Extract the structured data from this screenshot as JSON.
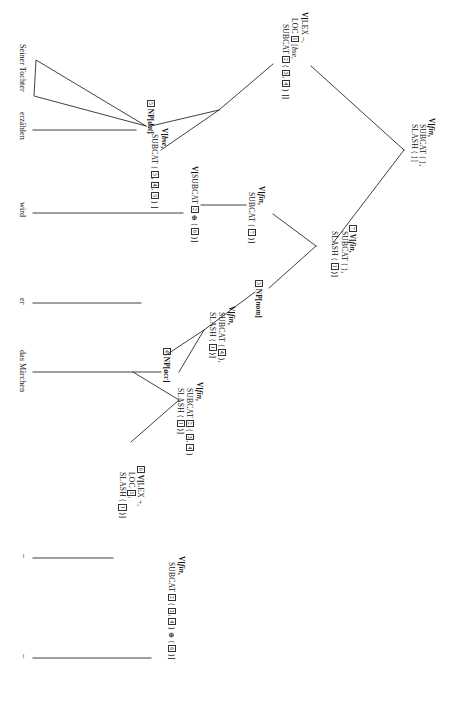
{
  "figure": {
    "kind": "syntax-tree",
    "framework": "HPSG",
    "orientation": "rotated-90-clockwise",
    "sentence": "Seiner Tochter erzählen wird er das Märchen"
  },
  "nodes": {
    "root": {
      "id": "root",
      "lines": [
        {
          "cat": "V[",
          "ital": "fin",
          "tail": ","
        },
        {
          "feat": "SUBCAT",
          "tail": " ⟨ ⟩,"
        },
        {
          "feat": "SLASH",
          "tail": " ⟨ ⟩]"
        }
      ]
    },
    "vlex_minus": {
      "id": "vlex-minus",
      "lines": [
        {
          "cat": "V[",
          "feat2": "LEX",
          "tail": " –,"
        },
        {
          "feat": "LOC",
          "tag": "1",
          "tail": " [",
          "ital": "bse",
          "tail2": ","
        },
        {
          "feat": "SUBCAT",
          "tag": "2",
          "tail": " ⟨ ",
          "tags": [
            "3",
            "4"
          ],
          "tail2": " ⟩ ]]"
        }
      ]
    },
    "v_fin_slash1": {
      "id": "v-fin-slash1",
      "lines": [
        {
          "cat": "V[",
          "ital": "fin",
          "tail": ","
        },
        {
          "feat": "SUBCAT",
          "tail": " ⟨ ⟩,"
        },
        {
          "feat": "SLASH",
          "tag": "1",
          "tail": " ⟨ ⟩]"
        }
      ]
    },
    "np_dat": {
      "id": "np-dat",
      "tag": "5",
      "cat": "NP[",
      "ital": "dat",
      "tail": "]"
    },
    "v_bse": {
      "id": "v-bse",
      "lines": [
        {
          "cat": "V[",
          "ital": "bse",
          "tail": ","
        },
        {
          "feat": "SUBCAT",
          "tail": " ⟨ ",
          "tags": [
            "3",
            "4",
            "5"
          ],
          "tail2": " ⟩ ]"
        }
      ]
    },
    "v_fin_subcat7": {
      "id": "v-fin-subcat7",
      "lines": [
        {
          "cat": "V[",
          "ital": "fin",
          "tail": ","
        },
        {
          "feat": "SUBCAT",
          "tail": " ⟨ ",
          "tags": [
            "7"
          ],
          "tail2": " ⟩ ]"
        }
      ]
    },
    "v_subcat_sum": {
      "id": "v-subcat-sum",
      "lines": [
        {
          "cat": "V[",
          "feat": "SUBCAT",
          "tag": "2",
          "tail": " ⊕ ⟨ ",
          "tags": [
            "6"
          ],
          "tail2": " ⟩ ]"
        }
      ]
    },
    "v_fin_7_slash1": {
      "id": "v-fin-7-slash1",
      "tag": "7",
      "lines": [
        {
          "cat": "V[",
          "ital": "fin",
          "tail": ","
        },
        {
          "feat": "SUBCAT",
          "tail": " ⟨ ⟩,"
        },
        {
          "feat": "SLASH",
          "tag": "1",
          "tail": " ⟨ ⟩]"
        }
      ]
    },
    "np_nom": {
      "id": "np-nom",
      "tag": "3",
      "cat": "NP[",
      "ital": "nom",
      "tail": "]"
    },
    "v_fin_sub4_slash1": {
      "id": "v-fin-sub4-slash1",
      "lines": [
        {
          "cat": "V[",
          "ital": "fin",
          "tail": ","
        },
        {
          "feat": "SUBCAT",
          "tail": " ⟨ ",
          "tags": [
            "4"
          ],
          "tail2": " ⟩,"
        },
        {
          "feat": "SLASH",
          "tag": "1",
          "tail": " ⟨ ⟩]"
        }
      ]
    },
    "np_acc": {
      "id": "np-acc",
      "tag": "4",
      "cat": "NP[",
      "ital": "acc",
      "tail": "]"
    },
    "v_fin_sub2_slash1": {
      "id": "v-fin-sub2-slash1",
      "lines": [
        {
          "cat": "V[",
          "ital": "fin",
          "tail": ","
        },
        {
          "feat": "SUBCAT",
          "tag": "2",
          "tail": " ⟨ ",
          "tags": [
            "3",
            "4"
          ],
          "tail2": " ⟩"
        },
        {
          "feat": "SLASH",
          "tag": "1",
          "tail": " ⟨ ⟩]"
        }
      ]
    },
    "vlex_plus": {
      "id": "vlex-plus",
      "tag": "6",
      "lines": [
        {
          "cat": "V[",
          "feat2": "LEX",
          "tail": " +,"
        },
        {
          "feat": "LOC",
          "tag": "1",
          "tail": ","
        },
        {
          "feat": "SLASH",
          "tag": "1",
          "tail": " ⟨ ⟩]"
        }
      ]
    },
    "v_fin_top": {
      "id": "v-fin-top",
      "lines": [
        {
          "cat": "V[",
          "ital": "fin",
          "tail": ","
        },
        {
          "feat": "SUBCAT",
          "tag": "2",
          "tail": " ⟨ ",
          "tags": [
            "3",
            "4"
          ],
          "tail2": " ⟩ ⊕ ⟨ ",
          "tags2": [
            "6"
          ],
          "tail3": " ⟩ ]"
        }
      ]
    }
  },
  "node_labels": {
    "root": "V[fin, SUBCAT ⟨ ⟩, SLASH ⟨ ⟩]",
    "vlex_minus": "V[LEX –, LOC 1[bse, SUBCAT 2 ⟨ 3, 4 ⟩ ]]",
    "v_fin_slash1": "V[fin, SUBCAT ⟨ ⟩, SLASH ⟨ 1 ⟩]",
    "np_dat": "5 NP[dat]",
    "v_bse": "V[bse, SUBCAT ⟨ 3, 4, 5 ⟩ ]",
    "v_fin_subcat7": "V[fin, SUBCAT ⟨ 7 ⟩ ]",
    "v_subcat_sum": "V[SUBCAT 2 ⊕ ⟨ 6 ⟩ ]",
    "v_fin_7_slash1": "7 V[fin, SUBCAT ⟨ ⟩, SLASH ⟨ 1 ⟩]",
    "np_nom": "3 NP[nom]",
    "v_fin_sub4_slash1": "V[fin, SUBCAT ⟨ 4 ⟩, SLASH ⟨ 1 ⟩]",
    "np_acc": "4 NP[acc]",
    "v_fin_sub2_slash1": "V[fin, SUBCAT 2 ⟨ 3, 4 ⟩ SLASH ⟨ 1 ⟩]",
    "vlex_plus": "6 V[LEX +, LOC 1, SLASH ⟨ 1 ⟩]",
    "v_fin_top": "V[fin, SUBCAT 2 ⟨ 3, 4 ⟩ ⊕ ⟨ 6 ⟩ ]"
  },
  "leaves": [
    {
      "id": "leaf-seiner-tochter",
      "text": "Seiner Tochter"
    },
    {
      "id": "leaf-erzaehlen",
      "text": "erzählen"
    },
    {
      "id": "leaf-wird",
      "text": "wird"
    },
    {
      "id": "leaf-er",
      "text": "er"
    },
    {
      "id": "leaf-das-maerchen",
      "text": "das Märchen"
    },
    {
      "id": "trace-1",
      "text": "–"
    },
    {
      "id": "trace-2",
      "text": "–"
    }
  ]
}
